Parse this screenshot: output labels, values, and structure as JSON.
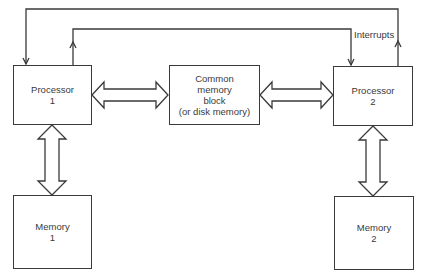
{
  "diagram": {
    "nodes": {
      "processor1": {
        "line1": "Processor",
        "line2": "1"
      },
      "processor2": {
        "line1": "Processor",
        "line2": "2"
      },
      "common": {
        "line1": "Common",
        "line2": "memory",
        "line3": "block",
        "line4": "(or disk memory)"
      },
      "memory1": {
        "line1": "Memory",
        "line2": "1"
      },
      "memory2": {
        "line1": "Memory",
        "line2": "2"
      }
    },
    "labels": {
      "interrupts": "Interrupts"
    },
    "edges": [
      {
        "from": "processor2",
        "to": "processor1",
        "type": "interrupt-line"
      },
      {
        "from": "processor1",
        "to": "processor2",
        "type": "interrupt-line"
      },
      {
        "from": "processor1",
        "to": "common",
        "type": "bidirectional-bus"
      },
      {
        "from": "common",
        "to": "processor2",
        "type": "bidirectional-bus"
      },
      {
        "from": "processor1",
        "to": "memory1",
        "type": "bidirectional-bus"
      },
      {
        "from": "processor2",
        "to": "memory2",
        "type": "bidirectional-bus"
      }
    ]
  }
}
